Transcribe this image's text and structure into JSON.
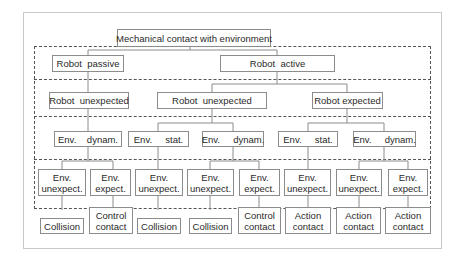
{
  "diagram": {
    "root": "Mechanical contact with environment",
    "level1": [
      "Robot  passive",
      "Robot  active"
    ],
    "level2": [
      "Robot  unexpected",
      "Robot  unexpected",
      "Robot expected"
    ],
    "level3": [
      "Env.    dynam.",
      "Env.     stat.",
      "Env.     dynam.",
      "Env.     stat.",
      "Env.     dynam."
    ],
    "level4": [
      "Env.\nunexpect.",
      "Env.\nexpect.",
      "Env.\nunexpect.",
      "Env.\nunexpect.",
      "Env.\nexpect.",
      "Env.\nunexpect.",
      "Env.\nunexpect.",
      "Env.\nexpect."
    ],
    "level5": [
      "Collision",
      "Control\ncontact",
      "Collision",
      "Collision",
      "Control\ncontact",
      "Action\ncontact",
      "Action\ncontact",
      "Action\ncontact"
    ]
  }
}
